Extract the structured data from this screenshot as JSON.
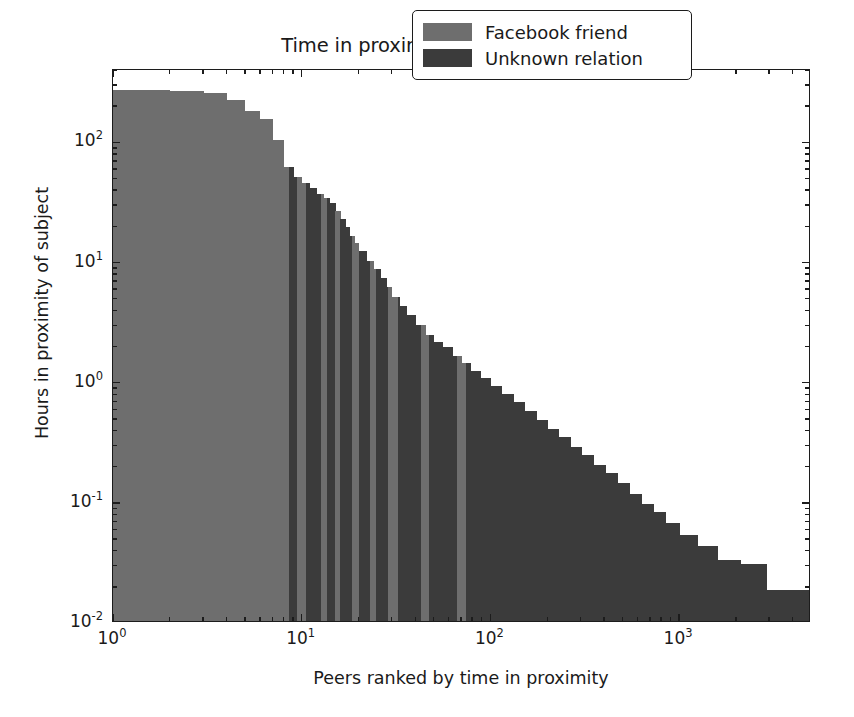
{
  "chart_data": {
    "type": "bar",
    "title": "Time in proximity to subject by peers",
    "xlabel": "Peers ranked by time in proximity",
    "ylabel": "Hours in proximity of subject",
    "xscale": "log",
    "yscale": "log",
    "xlim": [
      1,
      5000
    ],
    "ylim": [
      0.01,
      400
    ],
    "grid": false,
    "legend_position": "upper right",
    "xticks": [
      {
        "value": 1,
        "label": "10",
        "exp": "0"
      },
      {
        "value": 10,
        "label": "10",
        "exp": "1"
      },
      {
        "value": 100,
        "label": "10",
        "exp": "2"
      },
      {
        "value": 1000,
        "label": "10",
        "exp": "3"
      }
    ],
    "yticks": [
      {
        "value": 100,
        "label": "10",
        "exp": "2"
      },
      {
        "value": 10,
        "label": "10",
        "exp": "1"
      },
      {
        "value": 1,
        "label": "10",
        "exp": "0"
      },
      {
        "value": 0.1,
        "label": "10",
        "exp": "-1"
      },
      {
        "value": 0.01,
        "label": "10",
        "exp": "-2"
      }
    ],
    "series": [
      {
        "name": "Facebook friend",
        "color": "#6e6e6e",
        "key": "facebook"
      },
      {
        "name": "Unknown relation",
        "color": "#3b3b3b",
        "key": "unknown"
      }
    ],
    "bars": [
      {
        "rank": 1,
        "hours": 262,
        "relation": "facebook"
      },
      {
        "rank": 2,
        "hours": 258,
        "relation": "facebook"
      },
      {
        "rank": 3,
        "hours": 250,
        "relation": "facebook"
      },
      {
        "rank": 4,
        "hours": 218,
        "relation": "facebook"
      },
      {
        "rank": 5,
        "hours": 175,
        "relation": "facebook"
      },
      {
        "rank": 6,
        "hours": 150,
        "relation": "facebook"
      },
      {
        "rank": 7,
        "hours": 100,
        "relation": "facebook"
      },
      {
        "rank": 8,
        "hours": 60,
        "relation": "facebook"
      },
      {
        "rank": 9,
        "hours": 50,
        "relation": "unknown"
      },
      {
        "rank": 10,
        "hours": 44,
        "relation": "facebook"
      },
      {
        "rank": 11,
        "hours": 40,
        "relation": "unknown"
      },
      {
        "rank": 12,
        "hours": 36,
        "relation": "unknown"
      },
      {
        "rank": 13,
        "hours": 33,
        "relation": "facebook"
      },
      {
        "rank": 14,
        "hours": 30,
        "relation": "unknown"
      },
      {
        "rank": 15,
        "hours": 26,
        "relation": "facebook"
      },
      {
        "rank": 16,
        "hours": 22,
        "relation": "unknown"
      },
      {
        "rank": 17,
        "hours": 19,
        "relation": "unknown"
      },
      {
        "rank": 18,
        "hours": 16,
        "relation": "unknown"
      },
      {
        "rank": 19,
        "hours": 14,
        "relation": "facebook"
      },
      {
        "rank": 20,
        "hours": 12,
        "relation": "unknown"
      },
      {
        "rank": 22,
        "hours": 10,
        "relation": "unknown"
      },
      {
        "rank": 24,
        "hours": 8.5,
        "relation": "facebook"
      },
      {
        "rank": 26,
        "hours": 7.2,
        "relation": "unknown"
      },
      {
        "rank": 28,
        "hours": 6.0,
        "relation": "unknown"
      },
      {
        "rank": 30,
        "hours": 5.0,
        "relation": "facebook"
      },
      {
        "rank": 33,
        "hours": 4.2,
        "relation": "unknown"
      },
      {
        "rank": 36,
        "hours": 3.5,
        "relation": "unknown"
      },
      {
        "rank": 40,
        "hours": 2.9,
        "relation": "unknown"
      },
      {
        "rank": 45,
        "hours": 2.4,
        "relation": "facebook"
      },
      {
        "rank": 50,
        "hours": 2.1,
        "relation": "unknown"
      },
      {
        "rank": 56,
        "hours": 1.9,
        "relation": "unknown"
      },
      {
        "rank": 63,
        "hours": 1.6,
        "relation": "unknown"
      },
      {
        "rank": 70,
        "hours": 1.4,
        "relation": "facebook"
      },
      {
        "rank": 78,
        "hours": 1.2,
        "relation": "unknown"
      },
      {
        "rank": 88,
        "hours": 1.05,
        "relation": "unknown"
      },
      {
        "rank": 100,
        "hours": 0.9,
        "relation": "unknown"
      },
      {
        "rank": 115,
        "hours": 0.78,
        "relation": "unknown"
      },
      {
        "rank": 132,
        "hours": 0.66,
        "relation": "unknown"
      },
      {
        "rank": 152,
        "hours": 0.56,
        "relation": "unknown"
      },
      {
        "rank": 175,
        "hours": 0.47,
        "relation": "unknown"
      },
      {
        "rank": 200,
        "hours": 0.4,
        "relation": "unknown"
      },
      {
        "rank": 230,
        "hours": 0.34,
        "relation": "unknown"
      },
      {
        "rank": 265,
        "hours": 0.28,
        "relation": "unknown"
      },
      {
        "rank": 305,
        "hours": 0.24,
        "relation": "unknown"
      },
      {
        "rank": 350,
        "hours": 0.2,
        "relation": "unknown"
      },
      {
        "rank": 405,
        "hours": 0.17,
        "relation": "unknown"
      },
      {
        "rank": 470,
        "hours": 0.14,
        "relation": "unknown"
      },
      {
        "rank": 545,
        "hours": 0.115,
        "relation": "unknown"
      },
      {
        "rank": 630,
        "hours": 0.095,
        "relation": "unknown"
      },
      {
        "rank": 730,
        "hours": 0.08,
        "relation": "unknown"
      },
      {
        "rank": 850,
        "hours": 0.065,
        "relation": "unknown"
      },
      {
        "rank": 1000,
        "hours": 0.052,
        "relation": "unknown"
      },
      {
        "rank": 1250,
        "hours": 0.042,
        "relation": "unknown"
      },
      {
        "rank": 1600,
        "hours": 0.032,
        "relation": "unknown"
      },
      {
        "rank": 2100,
        "hours": 0.03,
        "relation": "unknown"
      },
      {
        "rank": 2900,
        "hours": 0.018,
        "relation": "unknown"
      },
      {
        "rank": 4000,
        "hours": 0.018,
        "relation": "unknown"
      }
    ],
    "facebook_bands": [
      [
        1.0,
        8.6
      ],
      [
        9.6,
        10.6
      ],
      [
        12.6,
        13.8
      ],
      [
        15.0,
        16.2
      ],
      [
        18.6,
        20.0
      ],
      [
        23.0,
        25.0
      ],
      [
        29.0,
        32.0
      ],
      [
        43.0,
        48.0
      ],
      [
        66.0,
        75.0
      ]
    ]
  }
}
